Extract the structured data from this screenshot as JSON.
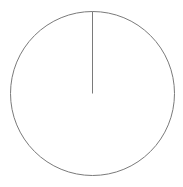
{
  "chart_data": {
    "type": "pie",
    "title": "",
    "categories": [
      "Slice 1"
    ],
    "values": [
      100
    ],
    "legend": [],
    "colors": {
      "fill": "#ffffff",
      "stroke": "#7a7a7a"
    },
    "geometry": {
      "cx": 92.5,
      "cy": 93.5,
      "r": 82,
      "start_angle_deg": -90
    }
  }
}
